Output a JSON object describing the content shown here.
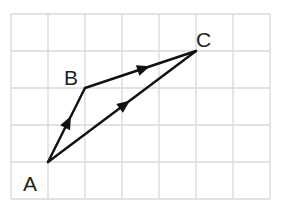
{
  "diagram": {
    "type": "vector-triangle-on-grid",
    "grid": {
      "columns": 7,
      "rows": 5,
      "origin_x": 11,
      "origin_y": 14,
      "cell": 37.0,
      "color": "#d9d9d9"
    },
    "points": {
      "A": {
        "label": "A",
        "gx": 1,
        "gy": 4
      },
      "B": {
        "label": "B",
        "gx": 2,
        "gy": 2
      },
      "C": {
        "label": "C",
        "gx": 5,
        "gy": 1
      }
    },
    "vectors": [
      {
        "from": "A",
        "to": "B",
        "arrow": true
      },
      {
        "from": "B",
        "to": "C",
        "arrow": true
      },
      {
        "from": "A",
        "to": "C",
        "arrow": true
      }
    ],
    "labels": {
      "A": "A",
      "B": "B",
      "C": "C"
    },
    "line_color": "#111111"
  }
}
